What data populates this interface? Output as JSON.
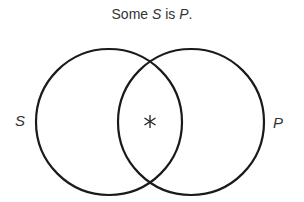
{
  "title": {
    "prefix": "Some ",
    "subject": "S",
    "middle": " is ",
    "predicate": "P",
    "suffix": "."
  },
  "diagram": {
    "type": "venn",
    "circles": [
      {
        "label": "S",
        "cx": 109,
        "cy": 122,
        "r": 73
      },
      {
        "label": "P",
        "cx": 191,
        "cy": 122,
        "r": 73
      }
    ],
    "marker": {
      "symbol": "*",
      "region": "S and P overlap"
    },
    "stroke_color": "#1a1a1a"
  }
}
